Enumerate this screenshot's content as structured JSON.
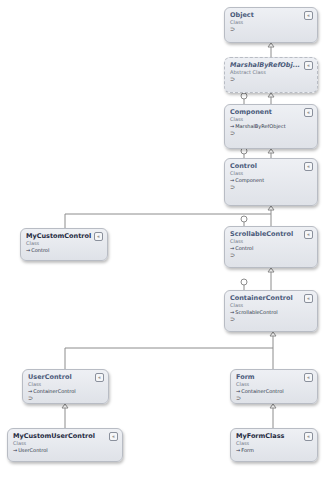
{
  "diagram": {
    "colors": {
      "box_fill": "#e6e8ee",
      "box_border": "#b8bcc4",
      "line": "#8c8c8c",
      "name_text": "#4a5a7a"
    },
    "classes": [
      {
        "id": "object",
        "name": "Object",
        "kind": "Class",
        "base": "",
        "lollipop": "⊃",
        "toggle": "«"
      },
      {
        "id": "marshal",
        "name": "MarshalByRefObj...",
        "kind": "Abstract Class",
        "base": "",
        "lollipop": "⊃",
        "toggle": "«"
      },
      {
        "id": "component",
        "name": "Component",
        "kind": "Class",
        "base": "MarshalByRefObject",
        "lollipop": "⊃",
        "toggle": "«"
      },
      {
        "id": "control",
        "name": "Control",
        "kind": "Class",
        "base": "Component",
        "lollipop": "⊃",
        "toggle": "«"
      },
      {
        "id": "mycustomcontrol",
        "name": "MyCustomControl",
        "kind": "Class",
        "base": "Control",
        "lollipop": "",
        "toggle": "«"
      },
      {
        "id": "scrollable",
        "name": "ScrollableControl",
        "kind": "Class",
        "base": "Control",
        "lollipop": "⊃",
        "toggle": "«"
      },
      {
        "id": "container",
        "name": "ContainerControl",
        "kind": "Class",
        "base": "ScrollableControl",
        "lollipop": "⊃",
        "toggle": "«"
      },
      {
        "id": "usercontrol",
        "name": "UserControl",
        "kind": "Class",
        "base": "ContainerControl",
        "lollipop": "⊃",
        "toggle": "«"
      },
      {
        "id": "form",
        "name": "Form",
        "kind": "Class",
        "base": "ContainerControl",
        "lollipop": "⊃",
        "toggle": "«"
      },
      {
        "id": "mycustomusercontrol",
        "name": "MyCustomUserControl",
        "kind": "Class",
        "base": "UserControl",
        "lollipop": "",
        "toggle": "«"
      },
      {
        "id": "myformclass",
        "name": "MyFormClass",
        "kind": "Class",
        "base": "Form",
        "lollipop": "",
        "toggle": "«"
      }
    ],
    "inheritance": [
      [
        "MarshalByRefObject",
        "Object"
      ],
      [
        "Component",
        "MarshalByRefObject"
      ],
      [
        "Control",
        "Component"
      ],
      [
        "MyCustomControl",
        "Control"
      ],
      [
        "ScrollableControl",
        "Control"
      ],
      [
        "ContainerControl",
        "ScrollableControl"
      ],
      [
        "UserControl",
        "ContainerControl"
      ],
      [
        "Form",
        "ContainerControl"
      ],
      [
        "MyCustomUserControl",
        "UserControl"
      ],
      [
        "MyFormClass",
        "Form"
      ]
    ],
    "arrow_glyph": "→"
  }
}
